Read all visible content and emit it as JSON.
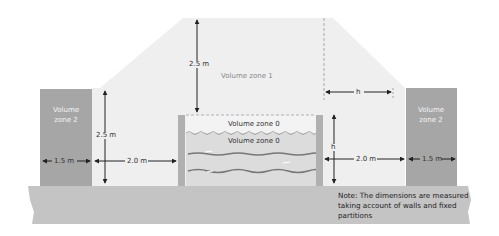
{
  "diagram": {
    "type": "bathroom-pool-volume-zones",
    "zones": {
      "zone1_label": "Volume zone 1",
      "zone0_upper_label": "Volume zone 0",
      "zone0_lower_label": "Volume zone 0",
      "zone2_left_label_line1": "Volume",
      "zone2_left_label_line2": "zone 2",
      "zone2_right_label_line1": "Volume",
      "zone2_right_label_line2": "zone 2"
    },
    "dimensions": {
      "zone1_height": "2.5 m",
      "left_height": "2.5 m",
      "left_zone2_width": "1.5 m",
      "left_clearance": "2.0 m",
      "right_clearance": "2.0 m",
      "right_zone2_width": "1.5 m",
      "right_h_vertical": "h",
      "right_h_horizontal": "h"
    },
    "note": "Note: The dimensions are measured taking account of walls and fixed partitions",
    "colors": {
      "zone1_fill": "#efefef",
      "zone2_fill": "#a6a6a6",
      "floor_fill": "#c4c4c4",
      "water_fill": "#dcdcdc",
      "wall_fill": "#b0b0b0",
      "arrow": "#222222"
    }
  }
}
